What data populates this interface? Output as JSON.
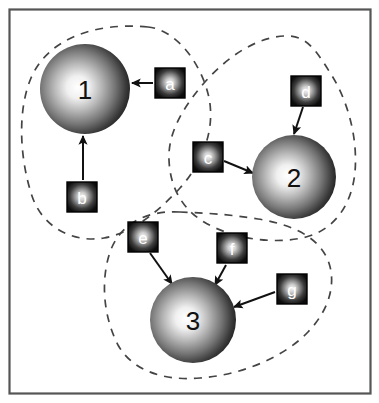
{
  "figure": {
    "title": "",
    "background_color": "#ffffff",
    "border_color": "#555555",
    "frame": {
      "x": 9,
      "y": 9,
      "width": 361,
      "height": 384
    }
  },
  "palette": {
    "sphere_highlight": "#ffffff",
    "sphere_mid": "#9a9a9a",
    "sphere_edge": "#1a1a1a",
    "box_highlight": "#f2f2f2",
    "box_edge": "#101010",
    "box_border": "#000000",
    "arrow_color": "#111111",
    "dashed_color": "#444444",
    "node_text_color": "#111111",
    "box_text_color": "#ffffff"
  },
  "nodes": [
    {
      "id": "n1",
      "label": "1",
      "cx": 85,
      "cy": 89,
      "r": 45,
      "font_size": 26
    },
    {
      "id": "n2",
      "label": "2",
      "cx": 294,
      "cy": 177,
      "r": 42,
      "font_size": 26
    },
    {
      "id": "n3",
      "label": "3",
      "cx": 193,
      "cy": 320,
      "r": 43,
      "font_size": 26
    }
  ],
  "boxes": [
    {
      "id": "a",
      "label": "a",
      "x": 155,
      "y": 68,
      "size": 30,
      "font_size": 17
    },
    {
      "id": "b",
      "label": "b",
      "x": 67,
      "y": 182,
      "size": 30,
      "font_size": 17
    },
    {
      "id": "c",
      "label": "c",
      "x": 193,
      "y": 142,
      "size": 30,
      "font_size": 17
    },
    {
      "id": "d",
      "label": "d",
      "x": 291,
      "y": 76,
      "size": 30,
      "font_size": 17
    },
    {
      "id": "e",
      "label": "e",
      "x": 128,
      "y": 222,
      "size": 30,
      "font_size": 17
    },
    {
      "id": "f",
      "label": "f",
      "x": 217,
      "y": 233,
      "size": 30,
      "font_size": 17
    },
    {
      "id": "g",
      "label": "g",
      "x": 277,
      "y": 274,
      "size": 30,
      "font_size": 17
    }
  ],
  "arrows": [
    {
      "id": "a-to-1",
      "from": "a",
      "to": "n1",
      "x1": 153,
      "y1": 83,
      "x2": 132,
      "y2": 83
    },
    {
      "id": "b-to-1",
      "from": "b",
      "to": "n1",
      "x1": 83,
      "y1": 180,
      "x2": 83,
      "y2": 136
    },
    {
      "id": "c-to-2",
      "from": "c",
      "to": "n2",
      "x1": 224,
      "y1": 161,
      "x2": 253,
      "y2": 173
    },
    {
      "id": "d-to-2",
      "from": "d",
      "to": "n2",
      "x1": 303,
      "y1": 107,
      "x2": 294,
      "y2": 134
    },
    {
      "id": "e-to-3",
      "from": "e",
      "to": "n3",
      "x1": 150,
      "y1": 253,
      "x2": 172,
      "y2": 284
    },
    {
      "id": "f-to-3",
      "from": "f",
      "to": "n3",
      "x1": 226,
      "y1": 265,
      "x2": 215,
      "y2": 285
    },
    {
      "id": "g-to-3",
      "from": "g",
      "to": "n3",
      "x1": 275,
      "y1": 292,
      "x2": 234,
      "y2": 307
    }
  ],
  "clusters": [
    {
      "id": "cluster-1",
      "name": "cluster-region-1",
      "members": [
        "n1",
        "a",
        "b"
      ],
      "path": "M 148 27 C 96 22 48 38 31 78 C 16 114 21 163 32 196 C 43 229 75 243 104 238 C 131 233 156 214 180 188 C 199 167 214 136 210 104 C 206 72 180 30 148 27 Z"
    },
    {
      "id": "cluster-2",
      "name": "cluster-region-2",
      "members": [
        "n2",
        "c",
        "d"
      ],
      "path": "M 284 36 C 248 38 214 68 192 98 C 176 120 168 140 169 160 C 170 186 181 208 204 222 C 232 239 275 245 306 237 C 336 229 352 203 355 172 C 358 136 347 98 329 71 C 314 47 305 35 284 36 Z"
    },
    {
      "id": "cluster-3",
      "name": "cluster-region-3",
      "members": [
        "n3",
        "e",
        "f",
        "g"
      ],
      "path": "M 180 212 C 146 210 120 224 110 252 C 100 282 104 318 118 345 C 133 372 166 381 200 378 C 241 375 283 358 308 332 C 331 308 337 280 327 258 C 316 235 289 224 258 219 C 228 214 203 213 180 212 Z"
    }
  ]
}
